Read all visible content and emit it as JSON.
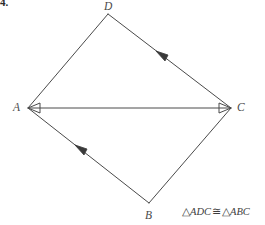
{
  "problem": {
    "number": "4."
  },
  "figure": {
    "vertices": [
      {
        "key": "D",
        "label": "D",
        "x": 108,
        "y": 14
      },
      {
        "key": "A",
        "label": "A",
        "x": 28,
        "y": 108
      },
      {
        "key": "C",
        "label": "C",
        "x": 231,
        "y": 108
      },
      {
        "key": "B",
        "label": "B",
        "x": 149,
        "y": 203
      }
    ],
    "edges": [
      {
        "name": "edge-ad",
        "from": "A",
        "to": "D",
        "marker": "none"
      },
      {
        "name": "edge-dc",
        "from": "D",
        "to": "C",
        "marker": "single-arrow-toward-D"
      },
      {
        "name": "edge-ab",
        "from": "A",
        "to": "B",
        "marker": "single-arrow-toward-A"
      },
      {
        "name": "edge-bc",
        "from": "B",
        "to": "C",
        "marker": "none"
      },
      {
        "name": "edge-ac-diagonal",
        "from": "A",
        "to": "C",
        "marker": "double-arrow"
      }
    ],
    "line_color": "#4a4a4a",
    "background_color": "#ffffff"
  },
  "caption": {
    "triangle_symbol_1": "△",
    "triangle_1": "ADC",
    "relation": "≅",
    "triangle_symbol_2": "△",
    "triangle_2": "ABC",
    "full_text": "△ADC ≅ △ABC"
  }
}
